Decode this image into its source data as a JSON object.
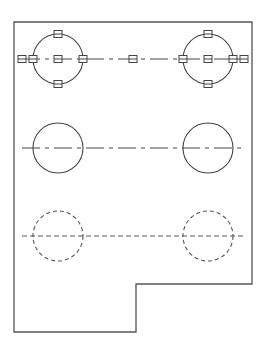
{
  "drawing": {
    "view": "plate-top-view",
    "colors": {
      "line": "#444444",
      "outline": "#555555",
      "background": "#ffffff"
    },
    "outline_points": "14,22 252,22 252,284 136,284 136,332 14,332",
    "rows": [
      {
        "name": "selected-holes-row",
        "y": 59,
        "style": "solid",
        "selected": true,
        "centerline": {
          "x1": 22,
          "x2": 245,
          "style": "center"
        },
        "holes": [
          {
            "cx": 58,
            "cy": 59,
            "r": 25
          },
          {
            "cx": 208,
            "cy": 59,
            "r": 25
          }
        ],
        "grips": [
          {
            "x": 22,
            "y": 59
          },
          {
            "x": 33,
            "y": 59
          },
          {
            "x": 58,
            "y": 34
          },
          {
            "x": 58,
            "y": 59
          },
          {
            "x": 58,
            "y": 84
          },
          {
            "x": 83,
            "y": 59
          },
          {
            "x": 133,
            "y": 59
          },
          {
            "x": 183,
            "y": 59
          },
          {
            "x": 208,
            "y": 34
          },
          {
            "x": 208,
            "y": 59
          },
          {
            "x": 208,
            "y": 84
          },
          {
            "x": 233,
            "y": 59
          },
          {
            "x": 244,
            "y": 59
          }
        ]
      },
      {
        "name": "visible-holes-row",
        "y": 148,
        "style": "solid",
        "selected": false,
        "centerline": {
          "x1": 22,
          "x2": 245,
          "style": "center"
        },
        "holes": [
          {
            "cx": 58,
            "cy": 148,
            "r": 25
          },
          {
            "cx": 208,
            "cy": 148,
            "r": 25
          }
        ]
      },
      {
        "name": "hidden-holes-row",
        "y": 236,
        "style": "dashed",
        "selected": false,
        "centerline": {
          "x1": 22,
          "x2": 245,
          "style": "hidden"
        },
        "holes": [
          {
            "cx": 58,
            "cy": 236,
            "r": 25
          },
          {
            "cx": 208,
            "cy": 236,
            "r": 25
          }
        ]
      }
    ]
  }
}
